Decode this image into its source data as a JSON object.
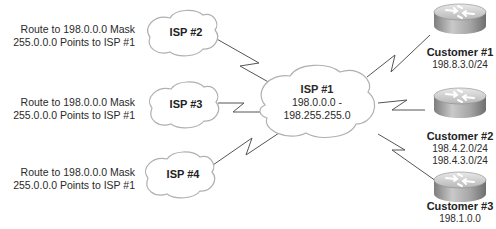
{
  "diagram": {
    "type": "network-topology",
    "colors": {
      "cloud_stroke": "#b0b0b0",
      "link": "#555555",
      "router_body": "#9a9a9a",
      "router_top": "#d6d6d6"
    },
    "route_labels": [
      {
        "line1": "Route to 198.0.0.0 Mask",
        "line2": "255.0.0.0 Points to ISP #1"
      },
      {
        "line1": "Route to 198.0.0.0 Mask",
        "line2": "255.0.0.0 Points to ISP #1"
      },
      {
        "line1": "Route to 198.0.0.0 Mask",
        "line2": "255.0.0.0 Points to ISP #1"
      }
    ],
    "isps": [
      {
        "name": "ISP #2"
      },
      {
        "name": "ISP #3"
      },
      {
        "name": "ISP #4"
      }
    ],
    "core": {
      "name": "ISP #1",
      "range_line1": "198.0.0.0 -",
      "range_line2": "198.255.255.0"
    },
    "customers": [
      {
        "name": "Customer #1",
        "nets": [
          "198.8.3.0/24"
        ]
      },
      {
        "name": "Customer #2",
        "nets": [
          "198.4.2.0/24",
          "198.4.3.0/24"
        ]
      },
      {
        "name": "Customer #3",
        "nets": [
          "198.1.0.0"
        ]
      }
    ],
    "links": [
      {
        "from": "ISP #2",
        "to": "ISP #1",
        "style": "serial-zigzag"
      },
      {
        "from": "ISP #3",
        "to": "ISP #1",
        "style": "serial-zigzag"
      },
      {
        "from": "ISP #4",
        "to": "ISP #1",
        "style": "serial-zigzag"
      },
      {
        "from": "ISP #1",
        "to": "Customer #1",
        "style": "serial-zigzag"
      },
      {
        "from": "ISP #1",
        "to": "Customer #2",
        "style": "serial-zigzag"
      },
      {
        "from": "ISP #1",
        "to": "Customer #3",
        "style": "serial-zigzag"
      }
    ]
  }
}
